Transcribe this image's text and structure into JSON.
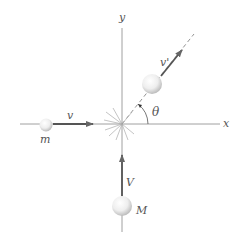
{
  "diagram": {
    "title": "",
    "axes": {
      "x_label": "x",
      "y_label": "y"
    },
    "bodies": [
      {
        "id": "m",
        "label": "m",
        "velocity_label": "v",
        "direction": "+x (incoming)"
      },
      {
        "id": "M",
        "label": "M",
        "velocity_label": "V",
        "direction": "+y (incoming)"
      },
      {
        "id": "combined",
        "label": "",
        "velocity_label": "v'",
        "direction": "outgoing at angle θ above +x"
      }
    ],
    "angle_label": "θ",
    "collision_point": "origin",
    "colors": {
      "axis": "#777777",
      "arrow": "#555555",
      "ball_light": "#ffffff",
      "ball_shade": "#c8c8c8",
      "text": "#555555"
    }
  }
}
